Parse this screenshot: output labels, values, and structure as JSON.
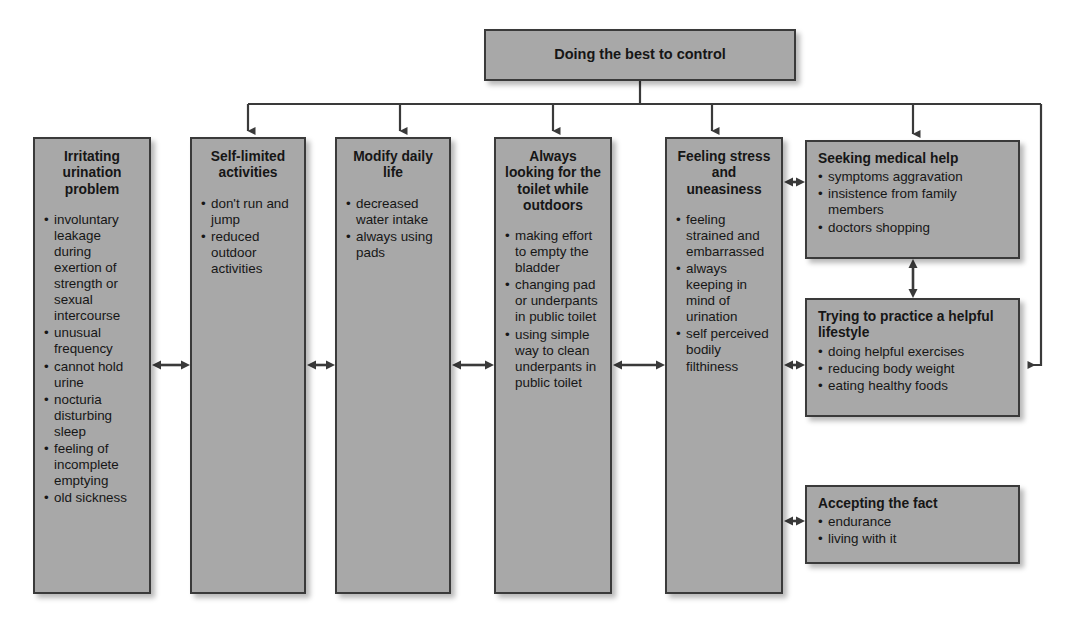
{
  "diagram": {
    "root": {
      "label": "Doing the best to control"
    },
    "columns": [
      {
        "id": "col-1",
        "title": "Irritating urination problem",
        "items": [
          "involuntary leakage during exertion of strength or sexual intercourse",
          "unusual frequency",
          "cannot hold urine",
          "nocturia disturbing sleep",
          "feeling of incomplete emptying",
          "old sickness"
        ]
      },
      {
        "id": "col-2",
        "title": "Self-limited activities",
        "items": [
          "don't run and jump",
          "reduced outdoor activities"
        ]
      },
      {
        "id": "col-3",
        "title": "Modify daily life",
        "items": [
          "decreased water intake",
          "always using pads"
        ]
      },
      {
        "id": "col-4",
        "title": "Always looking for the toilet while outdoors",
        "items": [
          "making effort to empty the bladder",
          "changing pad or underpants in public toilet",
          "using simple way to clean underpants in public toilet"
        ]
      },
      {
        "id": "col-5",
        "title": "Feeling stress and uneasiness",
        "items": [
          "feeling strained and embarrassed",
          "always keeping in mind of urination",
          "self perceived bodily filthiness"
        ]
      }
    ],
    "side_nodes": [
      {
        "id": "side-1",
        "title": "Seeking medical help",
        "items": [
          "symptoms aggravation",
          "insistence from family members",
          "doctors shopping"
        ]
      },
      {
        "id": "side-2",
        "title": "Trying to practice a helpful lifestyle",
        "items": [
          "doing helpful exercises",
          "reducing body weight",
          "eating healthy foods"
        ]
      },
      {
        "id": "side-3",
        "title": "Accepting the fact",
        "items": [
          "endurance",
          "living with it"
        ]
      }
    ],
    "connectors": {
      "down_arrow_icon": "arrow-down-icon",
      "double_arrow_icon": "double-headed-arrow-icon",
      "left_arrow_icon": "arrow-left-icon"
    },
    "colors": {
      "box_fill": "#a8a8a8",
      "box_border": "#3a3a3a",
      "line": "#3a3a3a",
      "text": "#161616",
      "background": "#ffffff"
    }
  }
}
